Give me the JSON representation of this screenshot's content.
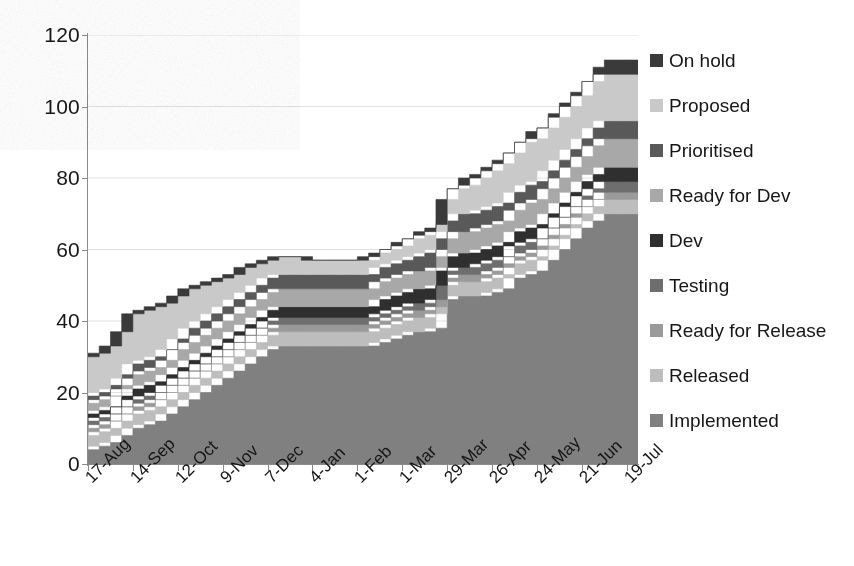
{
  "chart_data": {
    "type": "area",
    "stacked": true,
    "title": "",
    "xlabel": "",
    "ylabel": "",
    "ylim": [
      0,
      120
    ],
    "ytick_values": [
      0,
      20,
      40,
      60,
      80,
      100,
      120
    ],
    "grid": "horizontal-faint",
    "legend_position": "right",
    "categories": [
      "17-Aug",
      "24-Aug",
      "31-Aug",
      "7-Sep",
      "14-Sep",
      "21-Sep",
      "28-Sep",
      "5-Oct",
      "12-Oct",
      "19-Oct",
      "26-Oct",
      "2-Nov",
      "9-Nov",
      "16-Nov",
      "23-Nov",
      "30-Nov",
      "7-Dec",
      "14-Dec",
      "21-Dec",
      "28-Dec",
      "4-Jan",
      "11-Jan",
      "18-Jan",
      "25-Jan",
      "1-Feb",
      "8-Feb",
      "15-Feb",
      "22-Feb",
      "1-Mar",
      "8-Mar",
      "15-Mar",
      "22-Mar",
      "29-Mar",
      "5-Apr",
      "12-Apr",
      "19-Apr",
      "26-Apr",
      "3-May",
      "10-May",
      "17-May",
      "24-May",
      "31-May",
      "7-Jun",
      "14-Jun",
      "21-Jun",
      "28-Jun",
      "5-Jul",
      "12-Jul",
      "19-Jul",
      "26-Jul"
    ],
    "xtick_labels": [
      "17-Aug",
      "14-Sep",
      "12-Oct",
      "9-Nov",
      "7-Dec",
      "4-Jan",
      "1-Feb",
      "1-Mar",
      "29-Mar",
      "26-Apr",
      "24-May",
      "21-Jun",
      "19-Jul"
    ],
    "xtick_indices": [
      0,
      4,
      8,
      12,
      16,
      20,
      24,
      28,
      32,
      36,
      40,
      44,
      48
    ],
    "series": [
      {
        "name": "On hold",
        "color": "#3a3a3a",
        "values": [
          0,
          0,
          0,
          0,
          0,
          0,
          0,
          0,
          0,
          0,
          0,
          0,
          0,
          0,
          0,
          0,
          0,
          0,
          0,
          0,
          0,
          0,
          0,
          0,
          1,
          1,
          1,
          2,
          2,
          2,
          2,
          2,
          3,
          3,
          3,
          3,
          3,
          3,
          3,
          3,
          3,
          4,
          4,
          4,
          4,
          4,
          4,
          4,
          4,
          4
        ]
      },
      {
        "name": "Proposed",
        "color": "#c9c9c9",
        "values": [
          11,
          11,
          12,
          13,
          14,
          14,
          14,
          13,
          12,
          11,
          10,
          9,
          8,
          7,
          7,
          6,
          5,
          5,
          5,
          5,
          4,
          4,
          4,
          4,
          4,
          4,
          4,
          4,
          4,
          5,
          5,
          5,
          6,
          7,
          8,
          9,
          10,
          11,
          11,
          12,
          12,
          12,
          12,
          12,
          12,
          13,
          13,
          13,
          13,
          13
        ]
      },
      {
        "name": "Prioritised",
        "color": "#595959",
        "values": [
          2,
          2,
          2,
          2,
          3,
          3,
          3,
          3,
          3,
          4,
          4,
          4,
          4,
          4,
          4,
          4,
          4,
          4,
          4,
          4,
          4,
          4,
          4,
          4,
          4,
          4,
          4,
          4,
          4,
          4,
          5,
          5,
          5,
          5,
          5,
          5,
          5,
          5,
          5,
          5,
          5,
          5,
          5,
          5,
          5,
          5,
          5,
          5,
          5,
          5
        ]
      },
      {
        "name": "Ready for Dev",
        "color": "#a8a8a8",
        "values": [
          3,
          3,
          3,
          3,
          4,
          4,
          4,
          4,
          5,
          5,
          5,
          5,
          5,
          5,
          5,
          5,
          5,
          5,
          5,
          5,
          5,
          5,
          5,
          5,
          5,
          5,
          5,
          5,
          5,
          5,
          5,
          5,
          5,
          6,
          6,
          6,
          6,
          6,
          6,
          7,
          7,
          7,
          7,
          7,
          7,
          8,
          8,
          8,
          8,
          8
        ]
      },
      {
        "name": "Dev",
        "color": "#2f2f2f",
        "values": [
          2,
          2,
          2,
          3,
          3,
          3,
          3,
          3,
          3,
          3,
          3,
          3,
          3,
          3,
          3,
          3,
          3,
          3,
          3,
          3,
          3,
          3,
          3,
          3,
          3,
          3,
          4,
          4,
          4,
          4,
          4,
          4,
          4,
          4,
          4,
          4,
          4,
          4,
          4,
          4,
          4,
          4,
          4,
          4,
          4,
          4,
          4,
          4,
          4,
          4
        ]
      },
      {
        "name": "Testing",
        "color": "#6e6e6e",
        "values": [
          2,
          2,
          2,
          2,
          2,
          2,
          2,
          2,
          2,
          2,
          2,
          2,
          2,
          2,
          2,
          2,
          2,
          2,
          2,
          2,
          2,
          2,
          2,
          2,
          2,
          2,
          2,
          2,
          2,
          2,
          2,
          2,
          2,
          2,
          2,
          3,
          3,
          3,
          3,
          3,
          3,
          3,
          3,
          3,
          3,
          3,
          3,
          3,
          3,
          3
        ]
      },
      {
        "name": "Ready for Release",
        "color": "#9a9a9a",
        "values": [
          2,
          2,
          2,
          2,
          2,
          2,
          2,
          2,
          2,
          2,
          2,
          2,
          2,
          2,
          2,
          2,
          2,
          2,
          2,
          2,
          2,
          2,
          2,
          2,
          2,
          2,
          2,
          2,
          2,
          2,
          2,
          2,
          2,
          2,
          2,
          2,
          2,
          2,
          2,
          2,
          2,
          2,
          2,
          2,
          2,
          2,
          2,
          2,
          2,
          2
        ]
      },
      {
        "name": "Released",
        "color": "#bdbdbd",
        "values": [
          4,
          4,
          4,
          4,
          4,
          4,
          4,
          4,
          4,
          4,
          4,
          4,
          4,
          4,
          4,
          4,
          4,
          4,
          4,
          4,
          4,
          4,
          4,
          4,
          4,
          4,
          4,
          4,
          4,
          4,
          4,
          4,
          4,
          4,
          4,
          4,
          4,
          4,
          4,
          4,
          4,
          4,
          4,
          4,
          4,
          4,
          4,
          4,
          4,
          4
        ]
      },
      {
        "name": "Implemented",
        "color": "#808080",
        "values": [
          4,
          5,
          6,
          8,
          10,
          11,
          12,
          14,
          16,
          18,
          20,
          22,
          24,
          26,
          28,
          30,
          32,
          33,
          33,
          33,
          33,
          33,
          33,
          33,
          33,
          33,
          34,
          35,
          36,
          37,
          37,
          38,
          46,
          47,
          47,
          47,
          48,
          49,
          52,
          53,
          54,
          57,
          60,
          63,
          66,
          68,
          70,
          70,
          70,
          70
        ]
      }
    ],
    "totals": [
      30,
      31,
      33,
      37,
      42,
      43,
      44,
      45,
      46,
      49,
      50,
      52,
      52,
      53,
      55,
      56,
      57,
      58,
      58,
      58,
      57,
      57,
      57,
      57,
      58,
      58,
      60,
      62,
      63,
      65,
      66,
      67,
      77,
      81,
      82,
      84,
      87,
      89,
      92,
      95,
      96,
      100,
      103,
      106,
      109,
      114,
      116,
      116,
      116,
      116
    ]
  },
  "axis": {
    "y_tick_labels": [
      "120",
      "100",
      "80",
      "60",
      "40",
      "20",
      "0"
    ]
  },
  "legend": {
    "items": [
      {
        "label": "On hold",
        "swatch": "#3a3a3a"
      },
      {
        "label": "Proposed",
        "swatch": "#c9c9c9"
      },
      {
        "label": "Prioritised",
        "swatch": "#595959"
      },
      {
        "label": "Ready for Dev",
        "swatch": "#a8a8a8"
      },
      {
        "label": "Dev",
        "swatch": "#2f2f2f"
      },
      {
        "label": "Testing",
        "swatch": "#6e6e6e"
      },
      {
        "label": "Ready for Release",
        "swatch": "#9a9a9a"
      },
      {
        "label": "Released",
        "swatch": "#bdbdbd"
      },
      {
        "label": "Implemented",
        "swatch": "#808080"
      }
    ]
  }
}
